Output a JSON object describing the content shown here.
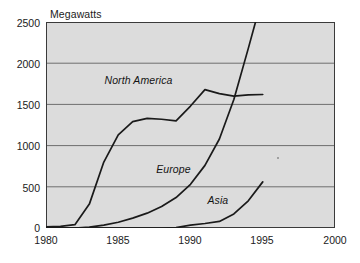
{
  "chart_data": {
    "type": "line",
    "title": "",
    "ylabel": "Megawatts",
    "xlabel": "",
    "xlim": [
      1980,
      2000
    ],
    "ylim": [
      0,
      2500
    ],
    "grid": "horizontal",
    "legend_position": "inline-labels",
    "y_ticks": [
      "0",
      "500",
      "1000",
      "1500",
      "2000",
      "2500"
    ],
    "y_tick_values": [
      0,
      500,
      1000,
      1500,
      2000,
      2500
    ],
    "x_ticks": [
      "1980",
      "1985",
      "1990",
      "1995",
      "2000"
    ],
    "x_tick_values": [
      1980,
      1985,
      1990,
      1995,
      2000
    ],
    "series": [
      {
        "name": "North America",
        "label": "North America",
        "label_x": 1986.4,
        "label_y": 1790,
        "x": [
          1980,
          1981,
          1982,
          1983,
          1984,
          1985,
          1986,
          1987,
          1988,
          1989,
          1990,
          1991,
          1992,
          1993,
          1994,
          1995
        ],
        "values": [
          15,
          20,
          40,
          290,
          800,
          1130,
          1290,
          1330,
          1320,
          1300,
          1480,
          1680,
          1630,
          1600,
          1615,
          1620
        ]
      },
      {
        "name": "Europe",
        "label": "Europe",
        "label_x": 1988.8,
        "label_y": 700,
        "x": [
          1980,
          1981,
          1982,
          1983,
          1984,
          1985,
          1986,
          1987,
          1988,
          1989,
          1990,
          1991,
          1992,
          1993,
          1994,
          1994.5
        ],
        "values": [
          0,
          0,
          0,
          10,
          35,
          70,
          120,
          180,
          260,
          370,
          530,
          760,
          1080,
          1560,
          2180,
          2500
        ]
      },
      {
        "name": "Asia",
        "label": "Asia",
        "label_x": 1991.9,
        "label_y": 330,
        "x": [
          1980,
          1985,
          1988,
          1989,
          1990,
          1991,
          1992,
          1993,
          1994,
          1995
        ],
        "values": [
          0,
          0,
          0,
          5,
          35,
          55,
          80,
          170,
          330,
          560
        ]
      }
    ],
    "artifacts": [
      {
        "name": "scan-speck",
        "x": 1996.0,
        "y": 860
      }
    ]
  },
  "colors": {
    "plot_background": "#dcdcdc",
    "line": "#1a1a1a",
    "gridline": "#6e6e6e",
    "axis": "#3a3a3a",
    "text": "#1b1b1b",
    "page_background": "#ffffff"
  }
}
